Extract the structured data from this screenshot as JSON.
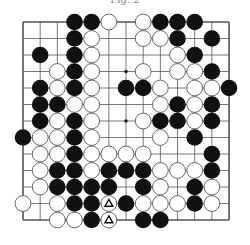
{
  "caption": "Fig. 2",
  "board": {
    "size": 13,
    "origin_x": 23,
    "origin_y": 22,
    "step_x": 17.17,
    "step_y": 16.5,
    "stone_radius": 8.3,
    "line_color": "#555555",
    "black_color": "#111111",
    "white_fill": "#ffffff",
    "white_stroke": "#555555",
    "star_points": [
      [
        6,
        3
      ],
      [
        6,
        6
      ]
    ],
    "stones": [
      {
        "c": 3,
        "r": 0,
        "color": "B"
      },
      {
        "c": 4,
        "r": 0,
        "color": "B"
      },
      {
        "c": 5,
        "r": 0,
        "color": "W"
      },
      {
        "c": 7,
        "r": 0,
        "color": "W"
      },
      {
        "c": 8,
        "r": 0,
        "color": "B"
      },
      {
        "c": 9,
        "r": 0,
        "color": "B"
      },
      {
        "c": 10,
        "r": 0,
        "color": "B"
      },
      {
        "c": 3,
        "r": 1,
        "color": "B"
      },
      {
        "c": 4,
        "r": 1,
        "color": "W"
      },
      {
        "c": 7,
        "r": 1,
        "color": "W"
      },
      {
        "c": 8,
        "r": 1,
        "color": "W"
      },
      {
        "c": 9,
        "r": 1,
        "color": "B"
      },
      {
        "c": 11,
        "r": 1,
        "color": "B"
      },
      {
        "c": 1,
        "r": 2,
        "color": "B"
      },
      {
        "c": 3,
        "r": 2,
        "color": "B"
      },
      {
        "c": 4,
        "r": 2,
        "color": "W"
      },
      {
        "c": 9,
        "r": 2,
        "color": "W"
      },
      {
        "c": 10,
        "r": 2,
        "color": "B"
      },
      {
        "c": 2,
        "r": 3,
        "color": "W"
      },
      {
        "c": 3,
        "r": 3,
        "color": "B"
      },
      {
        "c": 4,
        "r": 3,
        "color": "W"
      },
      {
        "c": 7,
        "r": 3,
        "color": "W"
      },
      {
        "c": 9,
        "r": 3,
        "color": "W"
      },
      {
        "c": 10,
        "r": 3,
        "color": "W"
      },
      {
        "c": 11,
        "r": 3,
        "color": "B"
      },
      {
        "c": 1,
        "r": 4,
        "color": "B"
      },
      {
        "c": 2,
        "r": 4,
        "color": "W"
      },
      {
        "c": 3,
        "r": 4,
        "color": "B"
      },
      {
        "c": 4,
        "r": 4,
        "color": "W"
      },
      {
        "c": 6,
        "r": 4,
        "color": "B"
      },
      {
        "c": 7,
        "r": 4,
        "color": "B"
      },
      {
        "c": 8,
        "r": 4,
        "color": "W"
      },
      {
        "c": 10,
        "r": 4,
        "color": "W"
      },
      {
        "c": 11,
        "r": 4,
        "color": "W"
      },
      {
        "c": 12,
        "r": 4,
        "color": "B"
      },
      {
        "c": 1,
        "r": 5,
        "color": "B"
      },
      {
        "c": 2,
        "r": 5,
        "color": "B"
      },
      {
        "c": 3,
        "r": 5,
        "color": "W"
      },
      {
        "c": 4,
        "r": 5,
        "color": "W"
      },
      {
        "c": 8,
        "r": 5,
        "color": "W"
      },
      {
        "c": 9,
        "r": 5,
        "color": "B"
      },
      {
        "c": 10,
        "r": 5,
        "color": "W"
      },
      {
        "c": 11,
        "r": 5,
        "color": "B"
      },
      {
        "c": 1,
        "r": 6,
        "color": "B"
      },
      {
        "c": 2,
        "r": 6,
        "color": "W"
      },
      {
        "c": 3,
        "r": 6,
        "color": "B"
      },
      {
        "c": 4,
        "r": 6,
        "color": "W"
      },
      {
        "c": 7,
        "r": 6,
        "color": "W"
      },
      {
        "c": 8,
        "r": 6,
        "color": "B"
      },
      {
        "c": 9,
        "r": 6,
        "color": "B"
      },
      {
        "c": 10,
        "r": 6,
        "color": "W"
      },
      {
        "c": 11,
        "r": 6,
        "color": "B"
      },
      {
        "c": 0,
        "r": 7,
        "color": "B"
      },
      {
        "c": 1,
        "r": 7,
        "color": "W"
      },
      {
        "c": 2,
        "r": 7,
        "color": "W"
      },
      {
        "c": 3,
        "r": 7,
        "color": "B"
      },
      {
        "c": 4,
        "r": 7,
        "color": "W"
      },
      {
        "c": 8,
        "r": 7,
        "color": "W"
      },
      {
        "c": 10,
        "r": 7,
        "color": "B"
      },
      {
        "c": 1,
        "r": 8,
        "color": "W"
      },
      {
        "c": 2,
        "r": 8,
        "color": "W"
      },
      {
        "c": 3,
        "r": 8,
        "color": "B"
      },
      {
        "c": 4,
        "r": 8,
        "color": "W"
      },
      {
        "c": 5,
        "r": 8,
        "color": "W"
      },
      {
        "c": 6,
        "r": 8,
        "color": "W"
      },
      {
        "c": 7,
        "r": 8,
        "color": "W"
      },
      {
        "c": 11,
        "r": 8,
        "color": "B"
      },
      {
        "c": 1,
        "r": 9,
        "color": "W"
      },
      {
        "c": 2,
        "r": 9,
        "color": "B"
      },
      {
        "c": 3,
        "r": 9,
        "color": "B"
      },
      {
        "c": 4,
        "r": 9,
        "color": "W"
      },
      {
        "c": 5,
        "r": 9,
        "color": "B"
      },
      {
        "c": 6,
        "r": 9,
        "color": "B"
      },
      {
        "c": 7,
        "r": 9,
        "color": "B"
      },
      {
        "c": 8,
        "r": 9,
        "color": "W"
      },
      {
        "c": 9,
        "r": 9,
        "color": "W"
      },
      {
        "c": 10,
        "r": 9,
        "color": "W"
      },
      {
        "c": 11,
        "r": 9,
        "color": "B"
      },
      {
        "c": 1,
        "r": 10,
        "color": "W"
      },
      {
        "c": 2,
        "r": 10,
        "color": "B"
      },
      {
        "c": 3,
        "r": 10,
        "color": "B"
      },
      {
        "c": 4,
        "r": 10,
        "color": "B"
      },
      {
        "c": 5,
        "r": 10,
        "color": "B"
      },
      {
        "c": 7,
        "r": 10,
        "color": "B"
      },
      {
        "c": 8,
        "r": 10,
        "color": "W"
      },
      {
        "c": 10,
        "r": 10,
        "color": "B"
      },
      {
        "c": 11,
        "r": 10,
        "color": "W"
      },
      {
        "c": 0,
        "r": 11,
        "color": "W"
      },
      {
        "c": 2,
        "r": 11,
        "color": "W"
      },
      {
        "c": 3,
        "r": 11,
        "color": "B"
      },
      {
        "c": 4,
        "r": 11,
        "color": "B"
      },
      {
        "c": 5,
        "r": 11,
        "color": "W",
        "mark": "triangle"
      },
      {
        "c": 6,
        "r": 11,
        "color": "B"
      },
      {
        "c": 7,
        "r": 11,
        "color": "W"
      },
      {
        "c": 8,
        "r": 11,
        "color": "W"
      },
      {
        "c": 9,
        "r": 11,
        "color": "W"
      },
      {
        "c": 10,
        "r": 11,
        "color": "B"
      },
      {
        "c": 11,
        "r": 11,
        "color": "W"
      },
      {
        "c": 2,
        "r": 12,
        "color": "W"
      },
      {
        "c": 3,
        "r": 12,
        "color": "W"
      },
      {
        "c": 4,
        "r": 12,
        "color": "B"
      },
      {
        "c": 5,
        "r": 12,
        "color": "W",
        "mark": "triangle"
      },
      {
        "c": 7,
        "r": 12,
        "color": "B"
      },
      {
        "c": 8,
        "r": 12,
        "color": "B"
      }
    ]
  }
}
